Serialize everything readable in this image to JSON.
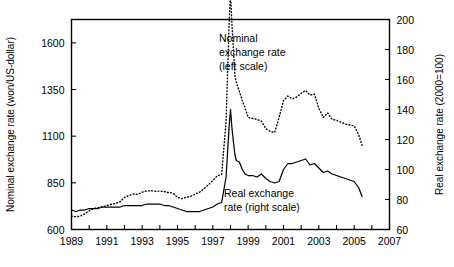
{
  "chart_data": {
    "type": "line",
    "title": "",
    "subtitle": "",
    "xlabel": "",
    "ylabel": "Nominal exchange rate (won/US-dollar)",
    "y2label": "Real exchange rate (2000=100)",
    "xlim": [
      1989,
      2007
    ],
    "ylim": [
      600,
      1725
    ],
    "y2lim": [
      60,
      200
    ],
    "grid": false,
    "legend_position": "inline-annotations",
    "x_ticks": [
      1989,
      1990,
      1991,
      1992,
      1993,
      1994,
      1995,
      1996,
      1997,
      1998,
      1999,
      2000,
      2001,
      2002,
      2003,
      2004,
      2005,
      2006,
      2007
    ],
    "x_tick_labels": [
      "1989",
      "",
      "1991",
      "",
      "1993",
      "",
      "1995",
      "",
      "1997",
      "",
      "1999",
      "",
      "2001",
      "",
      "2003",
      "",
      "2005",
      "",
      "2007"
    ],
    "y_ticks": [
      600,
      850,
      1100,
      1350,
      1600
    ],
    "y_tick_labels": [
      "600",
      "850",
      "1100",
      "1350",
      "1600"
    ],
    "y2_ticks": [
      60,
      80,
      100,
      120,
      140,
      160,
      180,
      200
    ],
    "y2_tick_labels": [
      "60",
      "80",
      "100",
      "120",
      "140",
      "160",
      "180",
      "200"
    ],
    "annotations": [
      {
        "id": "nominal-annotation",
        "lines": [
          "Nominal",
          "exchange rate",
          "(left scale)"
        ],
        "x": 1998.3,
        "y": 1660
      },
      {
        "id": "real-annotation",
        "lines": [
          "Real exchange",
          "rate (right scale)"
        ],
        "x": 1998.4,
        "y": 810
      }
    ],
    "series": [
      {
        "name": "Nominal exchange rate (left scale)",
        "axis": "left",
        "style": "dotted",
        "units": "won/US-dollar",
        "x": [
          1989.0,
          1989.25,
          1989.5,
          1989.75,
          1990.0,
          1990.25,
          1990.5,
          1990.75,
          1991.0,
          1991.25,
          1991.5,
          1991.75,
          1992.0,
          1992.25,
          1992.5,
          1992.75,
          1993.0,
          1993.25,
          1993.5,
          1993.75,
          1994.0,
          1994.25,
          1994.5,
          1994.75,
          1995.0,
          1995.25,
          1995.5,
          1995.75,
          1996.0,
          1996.25,
          1996.5,
          1996.75,
          1997.0,
          1997.25,
          1997.5,
          1997.75,
          1997.92,
          1998.0,
          1998.08,
          1998.17,
          1998.25,
          1998.33,
          1998.5,
          1998.67,
          1998.83,
          1999.0,
          1999.25,
          1999.5,
          1999.75,
          2000.0,
          2000.25,
          2000.5,
          2000.75,
          2001.0,
          2001.25,
          2001.5,
          2001.75,
          2002.0,
          2002.25,
          2002.5,
          2002.75,
          2003.0,
          2003.25,
          2003.5,
          2003.75,
          2004.0,
          2004.25,
          2004.5,
          2004.75,
          2005.0,
          2005.25,
          2005.45
        ],
        "y": [
          672,
          668,
          672,
          683,
          700,
          712,
          718,
          722,
          728,
          735,
          740,
          748,
          772,
          782,
          790,
          788,
          800,
          806,
          808,
          805,
          806,
          803,
          798,
          795,
          772,
          765,
          772,
          778,
          790,
          800,
          818,
          840,
          862,
          888,
          895,
          1180,
          1700,
          1870,
          1700,
          1560,
          1420,
          1390,
          1340,
          1290,
          1250,
          1200,
          1195,
          1190,
          1180,
          1140,
          1125,
          1120,
          1200,
          1290,
          1315,
          1300,
          1310,
          1330,
          1345,
          1320,
          1325,
          1250,
          1200,
          1225,
          1190,
          1185,
          1175,
          1165,
          1160,
          1155,
          1110,
          1050
        ],
        "y2_equivalent": [
          67,
          67,
          68,
          69,
          70,
          71,
          72,
          72,
          73,
          74,
          74,
          75,
          77,
          78,
          79,
          79,
          80,
          81,
          81,
          81,
          81,
          80,
          80,
          80,
          78,
          77,
          78,
          78,
          79,
          80,
          82,
          84,
          86,
          89,
          89,
          114,
          170,
          187,
          170,
          156,
          142,
          139,
          134,
          129,
          125,
          120,
          120,
          119,
          118,
          114,
          113,
          112,
          120,
          129,
          132,
          130,
          131,
          133,
          143,
          132,
          133,
          125,
          120,
          123,
          119,
          119,
          118,
          117,
          116,
          116,
          111,
          105
        ]
      },
      {
        "name": "Real exchange rate (right scale)",
        "axis": "right",
        "style": "solid",
        "units": "index 2000=100",
        "x": [
          1989.0,
          1989.25,
          1989.5,
          1989.75,
          1990.0,
          1990.25,
          1990.5,
          1990.75,
          1991.0,
          1991.25,
          1991.5,
          1991.75,
          1992.0,
          1992.25,
          1992.5,
          1992.75,
          1993.0,
          1993.25,
          1993.5,
          1993.75,
          1994.0,
          1994.25,
          1994.5,
          1994.75,
          1995.0,
          1995.25,
          1995.5,
          1995.75,
          1996.0,
          1996.25,
          1996.5,
          1996.75,
          1997.0,
          1997.25,
          1997.5,
          1997.75,
          1997.92,
          1998.0,
          1998.08,
          1998.17,
          1998.25,
          1998.33,
          1998.5,
          1998.67,
          1998.83,
          1999.0,
          1999.25,
          1999.5,
          1999.75,
          2000.0,
          2000.25,
          2000.5,
          2000.75,
          2001.0,
          2001.25,
          2001.5,
          2001.75,
          2002.0,
          2002.25,
          2002.5,
          2002.75,
          2003.0,
          2003.25,
          2003.5,
          2003.75,
          2004.0,
          2004.25,
          2004.5,
          2004.75,
          2005.0,
          2005.25,
          2005.45
        ],
        "y2": [
          73,
          72,
          73,
          73,
          74,
          74,
          74,
          75,
          75,
          75,
          75,
          75,
          76,
          76,
          76,
          76,
          76,
          77,
          77,
          77,
          77,
          76,
          76,
          75,
          74,
          73,
          72,
          72,
          72,
          72,
          73,
          74,
          75,
          77,
          78,
          95,
          128,
          140,
          128,
          118,
          110,
          106,
          105,
          100,
          97,
          96,
          96,
          95,
          97,
          94,
          92,
          91,
          92,
          100,
          104,
          104,
          105,
          106,
          107,
          103,
          104,
          101,
          98,
          99,
          97,
          96,
          95,
          94,
          93,
          92,
          88,
          82
        ]
      }
    ]
  },
  "axes": {
    "left_title": "Nominal exchange rate (won/US-dollar)",
    "right_title": "Real exchange rate (2000=100)"
  },
  "annotations": {
    "nominal": {
      "line1": "Nominal",
      "line2": "exchange rate",
      "line3": "(left scale)"
    },
    "real": {
      "line1": "Real exchange",
      "line2": "rate (right scale)"
    }
  },
  "colors": {
    "ink": "#000000",
    "background": "#ffffff"
  }
}
